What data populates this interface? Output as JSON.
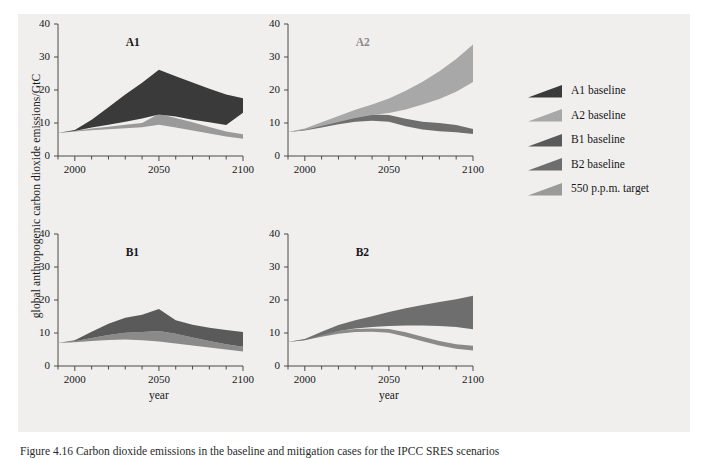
{
  "figure": {
    "background_color": "#f0efed",
    "y_axis_title": "global anthropogenic carbon dioxide emissions/GtC",
    "x_axis_title": "year",
    "caption": "Figure 4.16 Carbon dioxide emissions in the baseline and mitigation cases for the IPCC SRES scenarios"
  },
  "colors": {
    "a1_baseline": "#3a3a3a",
    "a2_baseline": "#a8a8a8",
    "b1_baseline": "#5a5a5a",
    "b2_baseline": "#6e6e6e",
    "target_550": "#9a9a9a",
    "axis": "#4a4a4a",
    "text": "#17171a"
  },
  "axes": {
    "y_ticks": [
      "0",
      "10",
      "20",
      "30",
      "40"
    ],
    "y_tick_values": [
      0,
      10,
      20,
      30,
      40
    ],
    "ylim": [
      0,
      40
    ],
    "x_ticks": [
      "2000",
      "2050",
      "2100"
    ],
    "x_tick_values": [
      2000,
      2050,
      2100
    ],
    "xlim": [
      1990,
      2100
    ],
    "x_minor_step": 10
  },
  "legend": {
    "items": [
      {
        "label": "A1 baseline",
        "color": "#3a3a3a"
      },
      {
        "label": "A2 baseline",
        "color": "#a8a8a8"
      },
      {
        "label": "B1 baseline",
        "color": "#5a5a5a"
      },
      {
        "label": "B2 baseline",
        "color": "#6e6e6e"
      },
      {
        "label": "550 p.p.m. target",
        "color": "#9a9a9a"
      }
    ]
  },
  "chart_data": {
    "type": "area",
    "xlabel": "year",
    "ylabel": "global anthropogenic carbon dioxide emissions/GtC",
    "xlim": [
      1990,
      2100
    ],
    "ylim": [
      0,
      40
    ],
    "grid": false,
    "legend_position": "right",
    "panels": [
      {
        "name": "A1",
        "title": "A1",
        "title_color": "#17171a",
        "series": [
          {
            "name": "A1 baseline",
            "color": "#3a3a3a",
            "x": [
              1990,
              2000,
              2010,
              2020,
              2030,
              2040,
              2050,
              2060,
              2070,
              2080,
              2090,
              2100
            ],
            "upper": [
              7.0,
              7.9,
              11.0,
              14.8,
              18.6,
              22.2,
              26.1,
              24.2,
              22.3,
              20.4,
              18.6,
              17.5
            ],
            "lower": [
              7.0,
              7.6,
              8.6,
              9.5,
              10.4,
              11.4,
              12.6,
              12.0,
              11.0,
              10.2,
              9.4,
              13.1
            ]
          },
          {
            "name": "550 p.p.m. target",
            "color": "#9a9a9a",
            "x": [
              1990,
              2000,
              2010,
              2020,
              2030,
              2040,
              2050,
              2060,
              2070,
              2080,
              2090,
              2100
            ],
            "upper": [
              7.0,
              7.6,
              8.3,
              8.9,
              9.5,
              10.0,
              12.8,
              11.5,
              10.2,
              8.8,
              7.4,
              6.6
            ],
            "lower": [
              7.0,
              7.4,
              7.8,
              8.1,
              8.4,
              8.7,
              9.5,
              8.6,
              7.7,
              6.8,
              5.9,
              5.2
            ]
          }
        ]
      },
      {
        "name": "A2",
        "title": "A2",
        "title_color": "#8a8a8a",
        "series": [
          {
            "name": "A2 baseline",
            "color": "#a8a8a8",
            "x": [
              1990,
              2000,
              2010,
              2020,
              2030,
              2040,
              2050,
              2060,
              2070,
              2080,
              2090,
              2100
            ],
            "upper": [
              7.3,
              8.3,
              10.2,
              12.1,
              14.0,
              15.6,
              17.4,
              19.8,
              22.5,
              25.7,
              29.4,
              33.8
            ],
            "lower": [
              7.3,
              7.9,
              9.1,
              10.3,
              11.5,
              12.4,
              13.0,
              14.1,
              15.6,
              17.3,
              19.5,
              22.4
            ]
          },
          {
            "name": "550 p.p.m. target",
            "color": "#6e6e6e",
            "x": [
              1990,
              2000,
              2010,
              2020,
              2030,
              2040,
              2050,
              2060,
              2070,
              2080,
              2090,
              2100
            ],
            "upper": [
              7.3,
              8.1,
              9.6,
              11.1,
              12.2,
              12.6,
              12.4,
              11.3,
              10.4,
              10.0,
              9.4,
              8.2
            ],
            "lower": [
              7.3,
              7.7,
              8.6,
              9.6,
              10.4,
              10.7,
              10.4,
              9.0,
              8.0,
              7.5,
              7.2,
              6.7
            ]
          }
        ]
      },
      {
        "name": "B1",
        "title": "B1",
        "title_color": "#17171a",
        "series": [
          {
            "name": "B1 baseline",
            "color": "#5a5a5a",
            "x": [
              1990,
              2000,
              2010,
              2020,
              2030,
              2040,
              2050,
              2060,
              2070,
              2080,
              2090,
              2100
            ],
            "upper": [
              7.0,
              7.8,
              10.4,
              12.8,
              14.6,
              15.5,
              17.3,
              13.9,
              12.5,
              11.6,
              10.9,
              10.3
            ],
            "lower": [
              7.0,
              7.5,
              8.5,
              9.4,
              10.1,
              10.3,
              10.6,
              9.8,
              8.6,
              7.6,
              6.6,
              5.8
            ]
          },
          {
            "name": "550 p.p.m. target",
            "color": "#8a8a8a",
            "x": [
              1990,
              2000,
              2010,
              2020,
              2030,
              2040,
              2050,
              2060,
              2070,
              2080,
              2090,
              2100
            ],
            "upper": [
              7.0,
              7.5,
              8.5,
              9.4,
              10.1,
              10.3,
              10.6,
              9.8,
              8.6,
              7.6,
              6.6,
              5.8
            ],
            "lower": [
              7.0,
              7.2,
              7.6,
              7.9,
              8.0,
              7.8,
              7.4,
              6.8,
              6.2,
              5.6,
              5.0,
              4.4
            ]
          }
        ]
      },
      {
        "name": "B2",
        "title": "B2",
        "title_color": "#17171a",
        "series": [
          {
            "name": "B2 baseline",
            "color": "#6e6e6e",
            "x": [
              1990,
              2000,
              2010,
              2020,
              2030,
              2040,
              2050,
              2060,
              2070,
              2080,
              2090,
              2100
            ],
            "upper": [
              7.3,
              8.2,
              10.4,
              12.4,
              13.9,
              15.1,
              16.4,
              17.5,
              18.5,
              19.4,
              20.2,
              21.3
            ],
            "lower": [
              7.3,
              7.9,
              9.3,
              10.6,
              11.4,
              11.8,
              12.1,
              12.3,
              12.3,
              12.1,
              11.8,
              11.1
            ]
          },
          {
            "name": "550 p.p.m. target",
            "color": "#8a8a8a",
            "x": [
              1990,
              2000,
              2010,
              2020,
              2030,
              2040,
              2050,
              2060,
              2070,
              2080,
              2090,
              2100
            ],
            "upper": [
              7.3,
              8.1,
              9.6,
              10.7,
              11.2,
              11.4,
              11.2,
              10.2,
              8.9,
              7.6,
              6.6,
              6.1
            ],
            "lower": [
              7.3,
              7.8,
              8.9,
              9.8,
              10.3,
              10.4,
              10.1,
              8.9,
              7.5,
              6.2,
              5.2,
              4.7
            ]
          }
        ]
      }
    ]
  }
}
